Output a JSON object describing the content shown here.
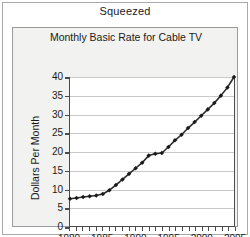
{
  "figure": {
    "caption": "Squeezed"
  },
  "chart_data": {
    "type": "line",
    "title": "Monthly Basic Rate for Cable TV",
    "xlabel": "",
    "ylabel": "Dollars Per Month",
    "xlim": [
      1980,
      2005
    ],
    "ylim": [
      0,
      40
    ],
    "ytick_labels": [
      "0",
      "5",
      "10",
      "15",
      "20",
      "25",
      "30",
      "35",
      "40"
    ],
    "ytick_values": [
      0,
      5,
      10,
      15,
      20,
      25,
      30,
      35,
      40
    ],
    "xtick_labels": [
      "1980",
      "1985",
      "1990",
      "1995",
      "2000",
      "2005"
    ],
    "xtick_values": [
      1980,
      1985,
      1990,
      1995,
      2000,
      2005
    ],
    "minor_xticks_every": 1,
    "grid": "horizontal",
    "legend": "none",
    "marker": "diamond",
    "line_color": "#2b2b2b",
    "marker_color": "#1a1a1a",
    "x": [
      1980,
      1981,
      1982,
      1983,
      1984,
      1985,
      1986,
      1987,
      1988,
      1989,
      1990,
      1991,
      1992,
      1993,
      1994,
      1995,
      1996,
      1997,
      1998,
      1999,
      2000,
      2001,
      2002,
      2003,
      2004,
      2005
    ],
    "values": [
      7.3,
      7.5,
      7.8,
      8.0,
      8.2,
      8.6,
      9.6,
      11.0,
      12.5,
      14.0,
      15.5,
      17.0,
      18.9,
      19.4,
      19.6,
      21.2,
      23.0,
      24.5,
      26.3,
      27.9,
      29.6,
      31.3,
      33.0,
      35.0,
      37.2,
      40.0
    ]
  }
}
